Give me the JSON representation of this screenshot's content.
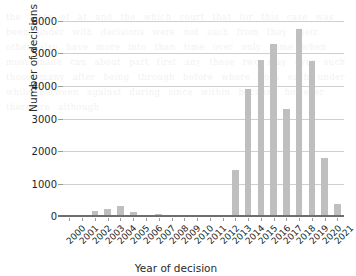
{
  "chart_data": {
    "type": "bar",
    "title": "",
    "xlabel": "Year of decision",
    "ylabel": "Number of decisions",
    "categories": [
      "2000",
      "2001",
      "2002",
      "2003",
      "2004",
      "2005",
      "2006",
      "2007",
      "2008",
      "2009",
      "2010",
      "2011",
      "2012",
      "2013",
      "2014",
      "2015",
      "2016",
      "2017",
      "2018",
      "2019",
      "2020",
      "2021"
    ],
    "values": [
      10,
      20,
      140,
      205,
      310,
      120,
      40,
      60,
      45,
      15,
      20,
      25,
      30,
      1430,
      3900,
      4810,
      5280,
      3290,
      5740,
      4760,
      1800,
      355
    ],
    "series": [
      {
        "name": "Number of decisions",
        "values": [
          10,
          20,
          140,
          205,
          310,
          120,
          40,
          60,
          45,
          15,
          20,
          25,
          30,
          1430,
          3900,
          4810,
          5280,
          3290,
          5740,
          4760,
          1800,
          355
        ]
      }
    ],
    "ylim": [
      0,
      6000
    ],
    "yticks": [
      "0",
      "1000",
      "2000",
      "3000",
      "4000",
      "5000",
      "6000"
    ],
    "ytick_values": [
      0,
      1000,
      2000,
      3000,
      4000,
      5000,
      6000
    ],
    "grid": "horizontal",
    "legend": "none",
    "bar_color": "#bfbfbf",
    "gridline_color": "#cfcfcf",
    "axis_color": "#6e6e6e",
    "xtick_rotation": -45
  },
  "background_bleed": "the state of at and the which court that for this case was been under with decisions were not such from they their other also have more into than time over only some when most made can about part first any these two may over such those many after being through before where both each under while between against during since within because however therefore although"
}
